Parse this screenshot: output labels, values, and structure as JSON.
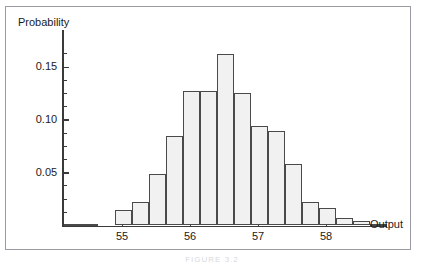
{
  "figure": {
    "frame_border_color": "#9a9aa5",
    "background": "#ffffff",
    "caption": "FIGURE 3.2"
  },
  "axes": {
    "y_axis_title": "Probability",
    "x_axis_title": "Output",
    "y_tick_labels": [
      "0.05",
      "0.10",
      "0.15"
    ],
    "x_tick_labels": [
      "55",
      "56",
      "57",
      "58"
    ],
    "bar_fill": "#f1f1f1",
    "bar_stroke": "#4a4a4a",
    "axis_color": "#3a3a3a"
  },
  "chart_data": {
    "type": "bar",
    "title": "",
    "subtitle": "",
    "xlabel": "Output",
    "ylabel": "Probability",
    "xlim": [
      54.1,
      58.85
    ],
    "ylim": [
      0,
      0.175
    ],
    "grid": false,
    "legend": null,
    "bin_width": 0.25,
    "x_ticks": [
      55,
      56,
      57,
      58
    ],
    "y_ticks": [
      0.05,
      0.1,
      0.15
    ],
    "y_minor_ticks": [
      0.0125,
      0.025,
      0.0375,
      0.0625,
      0.075,
      0.0875,
      0.1125,
      0.125,
      0.1375,
      0.1625
    ],
    "bin_left_edges": [
      54.15,
      54.4,
      54.65,
      54.9,
      55.15,
      55.4,
      55.65,
      55.9,
      56.15,
      56.4,
      56.65,
      56.9,
      57.15,
      57.4,
      57.65,
      57.9,
      58.15
    ],
    "bin_centers": [
      54.275,
      54.525,
      54.775,
      55.025,
      55.275,
      55.525,
      55.775,
      56.025,
      56.275,
      56.525,
      56.775,
      57.025,
      57.275,
      57.525,
      57.775,
      58.025,
      58.275
    ],
    "values": [
      0.001,
      0.001,
      0.0,
      0.015,
      0.022,
      0.049,
      0.085,
      0.127,
      0.127,
      0.162,
      0.125,
      0.094,
      0.089,
      0.058,
      0.022,
      0.017,
      0.007
    ],
    "extra_bins": [
      {
        "center": 58.525,
        "value": 0.004
      },
      {
        "center": 58.775,
        "value": 0.0005
      }
    ]
  }
}
